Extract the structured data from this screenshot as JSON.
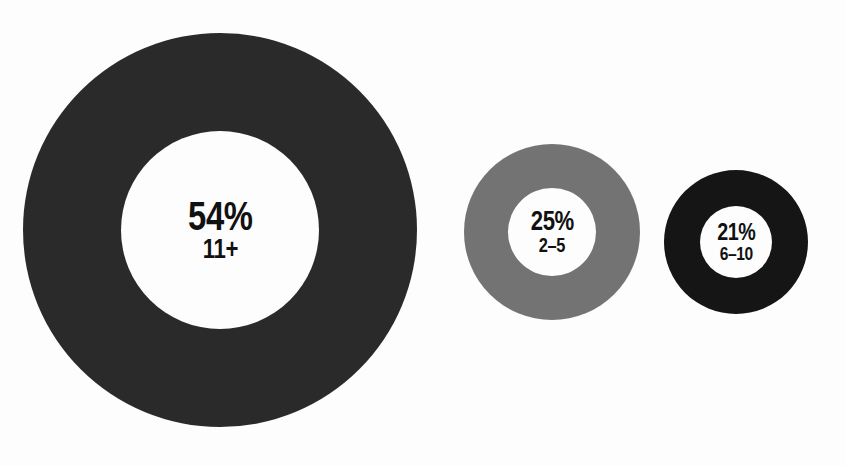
{
  "chart_data": {
    "type": "pie",
    "title": "",
    "subtitle": "",
    "xlabel": "",
    "ylabel": "",
    "legend_position": "none",
    "grid": false,
    "note": "Three proportional donut charts, each annotated with a percentage and its category range label. Circle area scales with the percentage value.",
    "categories": [
      "11+",
      "2-5",
      "6-10"
    ],
    "values": [
      54,
      25,
      21
    ],
    "value_suffix": "%",
    "series": [
      {
        "name": "share",
        "values": [
          54,
          25,
          21
        ]
      }
    ],
    "slices": [
      {
        "id": "slice-11-plus",
        "percent_label": "54%",
        "value": 54,
        "category_label": "11+",
        "color": "#2a2a2a",
        "hole_color": "#fdfdfd",
        "outer_diameter_px": 394,
        "inner_diameter_px": 198
      },
      {
        "id": "slice-2-5",
        "percent_label": "25%",
        "value": 25,
        "category_label": "2–5",
        "color": "#737373",
        "hole_color": "#fdfdfd",
        "outer_diameter_px": 176,
        "inner_diameter_px": 88
      },
      {
        "id": "slice-6-10",
        "percent_label": "21%",
        "value": 21,
        "category_label": "6–10",
        "color": "#151515",
        "hole_color": "#fdfdfd",
        "outer_diameter_px": 144,
        "inner_diameter_px": 72
      }
    ],
    "colors": {
      "background": "#fdfdfd",
      "text": "#111111",
      "ring_large": "#2a2a2a",
      "ring_medium": "#737373",
      "ring_small": "#151515"
    }
  }
}
